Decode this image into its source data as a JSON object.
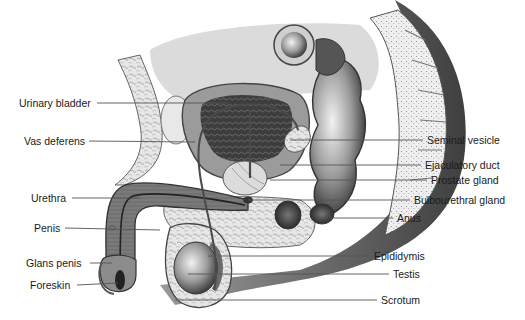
{
  "diagram": {
    "style": "grayscale medical illustration",
    "colors": {
      "background": "#ffffff",
      "label_text": "#1a1a1a",
      "leader_line": "#555555",
      "tissue_dark": "#3a3a3a",
      "tissue_mid": "#8a8a8a",
      "tissue_light": "#d9d9d9"
    },
    "labels_left": [
      {
        "id": "urinary-bladder",
        "text": "Urinary bladder",
        "x": 19,
        "y": 97,
        "line_to": [
          228,
          102
        ]
      },
      {
        "id": "vas-deferens",
        "text": "Vas deferens",
        "x": 24,
        "y": 135,
        "line_to": [
          195,
          142
        ]
      },
      {
        "id": "urethra",
        "text": "Urethra",
        "x": 31,
        "y": 192,
        "line_to": [
          140,
          198
        ]
      },
      {
        "id": "penis",
        "text": "Penis",
        "x": 34,
        "y": 222,
        "line_to": [
          160,
          230
        ]
      },
      {
        "id": "glans-penis",
        "text": "Glans penis",
        "x": 26,
        "y": 257,
        "line_to": [
          112,
          263
        ]
      },
      {
        "id": "foreskin",
        "text": "Foreskin",
        "x": 30,
        "y": 279,
        "line_to": [
          118,
          282
        ]
      }
    ],
    "labels_right": [
      {
        "id": "seminal-vesicle",
        "text": "Seminal vesicle",
        "x": 427,
        "y": 134,
        "line_to": [
          290,
          140
        ]
      },
      {
        "id": "ejaculatory-duct",
        "text": "Ejaculatory duct",
        "x": 425,
        "y": 160,
        "line_to": [
          280,
          165
        ]
      },
      {
        "id": "prostate-gland",
        "text": "Prostate gland",
        "x": 431,
        "y": 175,
        "line_to": [
          270,
          180
        ]
      },
      {
        "id": "bulbourethral-gland",
        "text": "Bulbourethral gland",
        "x": 414,
        "y": 195,
        "line_to": [
          248,
          200
        ]
      },
      {
        "id": "anus",
        "text": "Anus",
        "x": 397,
        "y": 212,
        "line_to": [
          330,
          218
        ]
      },
      {
        "id": "epididymis",
        "text": "Epididymis",
        "x": 374,
        "y": 250,
        "line_to": [
          208,
          256
        ]
      },
      {
        "id": "testis",
        "text": "Testis",
        "x": 393,
        "y": 269,
        "line_to": [
          188,
          274
        ]
      },
      {
        "id": "scrotum",
        "text": "Scrotum",
        "x": 381,
        "y": 295,
        "line_to": [
          175,
          300
        ]
      }
    ]
  }
}
